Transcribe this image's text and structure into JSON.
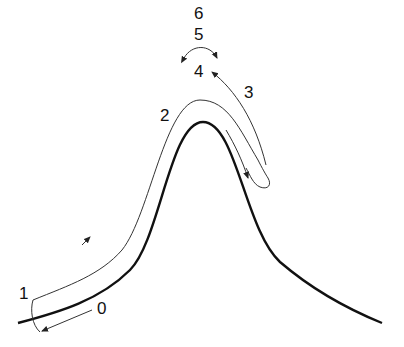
{
  "diagram": {
    "type": "path-around-peak",
    "colors": {
      "curve": "#111111",
      "path": "#333333",
      "background": "#ffffff"
    },
    "labels": [
      {
        "id": "0",
        "text": "0"
      },
      {
        "id": "1",
        "text": "1"
      },
      {
        "id": "2",
        "text": "2"
      },
      {
        "id": "3",
        "text": "3"
      },
      {
        "id": "4",
        "text": "4"
      },
      {
        "id": "5",
        "text": "5"
      },
      {
        "id": "6",
        "text": "6"
      }
    ],
    "elements": {
      "main_curve": "bell-shaped thick curve",
      "trajectory": "thin path tracing above curve from 1 over peak (2) to hook near 3",
      "arrow_0": "arrow from label 0 pointing left toward start",
      "arrow_3": "arrow from hook up to label 4",
      "arrow_5": "double-headed arc arrow at 5"
    }
  }
}
